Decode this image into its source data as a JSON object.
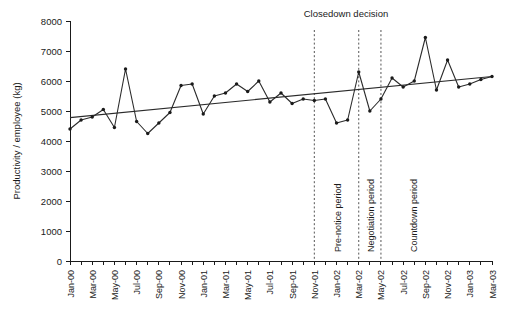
{
  "chart_data": {
    "type": "line",
    "title": "",
    "xlabel": "",
    "ylabel": "Productivity / employee (kg)",
    "ylim": [
      0,
      8000
    ],
    "ytick_step": 1000,
    "yticks": [
      0,
      1000,
      2000,
      3000,
      4000,
      5000,
      6000,
      7000,
      8000
    ],
    "grid": false,
    "legend": "none",
    "x_tick_labels": [
      "Jan-00",
      "Mar-00",
      "May-00",
      "Jul-00",
      "Sep-00",
      "Nov-00",
      "Jan-01",
      "Mar-01",
      "May-01",
      "Jul-01",
      "Sep-01",
      "Nov-01",
      "Jan-02",
      "Mar-02",
      "May-02",
      "Jul-02",
      "Sep-02",
      "Nov-02",
      "Jan-03",
      "Mar-03"
    ],
    "x_tick_interval_months": 2,
    "x_range": [
      "Jan-00",
      "Mar-03"
    ],
    "categories": [
      "Jan-00",
      "Feb-00",
      "Mar-00",
      "Apr-00",
      "May-00",
      "Jun-00",
      "Jul-00",
      "Aug-00",
      "Sep-00",
      "Oct-00",
      "Nov-00",
      "Dec-00",
      "Jan-01",
      "Feb-01",
      "Mar-01",
      "Apr-01",
      "May-01",
      "Jun-01",
      "Jul-01",
      "Aug-01",
      "Sep-01",
      "Oct-01",
      "Nov-01",
      "Dec-01",
      "Jan-02",
      "Feb-02",
      "Mar-02",
      "Apr-02",
      "May-02",
      "Jun-02",
      "Jul-02",
      "Aug-02",
      "Sep-02",
      "Oct-02",
      "Nov-02",
      "Dec-02",
      "Jan-03",
      "Feb-03",
      "Mar-03"
    ],
    "series": [
      {
        "name": "Productivity per employee",
        "style": "line-with-markers",
        "values": [
          4400,
          4700,
          4800,
          5050,
          4450,
          6400,
          4650,
          4250,
          4600,
          4950,
          5850,
          5900,
          4900,
          5500,
          5600,
          5900,
          5650,
          6000,
          5300,
          5600,
          5250,
          5400,
          5350,
          5400,
          4600,
          4700,
          6300,
          5000,
          5400,
          6100,
          5800,
          6000,
          7450,
          5700,
          6700,
          5800,
          5900,
          6050,
          6150
        ]
      },
      {
        "name": "Linear trend",
        "style": "straight-line",
        "from": {
          "x": "Jan-00",
          "y": 4780
        },
        "to": {
          "x": "Mar-03",
          "y": 6150
        }
      }
    ],
    "annotations": [
      {
        "name": "closedown-decision",
        "label": "Closedown decision",
        "x": "Mar-02",
        "type": "text-above-dotted-line"
      },
      {
        "name": "pre-notice-period",
        "label": "Pre-notice period",
        "type": "vertical-label",
        "span": [
          "Nov-01",
          "Mar-02"
        ]
      },
      {
        "name": "negotiation-period",
        "label": "Negotiation period",
        "type": "vertical-label",
        "span": [
          "Mar-02",
          "May-02"
        ]
      },
      {
        "name": "countdown-period",
        "label": "Countdown period",
        "type": "vertical-label",
        "span": [
          "May-02",
          "Mar-03"
        ]
      }
    ],
    "event_lines": [
      {
        "name": "pre-notice-start",
        "x": "Nov-01"
      },
      {
        "name": "closedown-decision-line",
        "x": "Mar-02"
      },
      {
        "name": "countdown-start",
        "x": "May-02"
      }
    ],
    "colors": {
      "series": "#2b2b2b",
      "trend": "#2b2b2b",
      "axis": "#1a1a1a",
      "event_line": "#555555",
      "background": "#ffffff"
    }
  }
}
